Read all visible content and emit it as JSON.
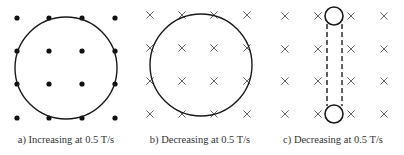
{
  "figure": {
    "panels": [
      {
        "id": "a",
        "caption": "a) Increasing at 0.5 T/s",
        "field_symbol": "dot",
        "field_direction": "out-of-page",
        "loop": "large-circle",
        "grid_x": [
          17,
          49,
          82,
          115
        ],
        "grid_y": [
          18,
          51,
          84,
          118
        ],
        "loop_geometry": {
          "cx": 66,
          "cy": 68,
          "r": 51
        },
        "caption_center_x": 66
      },
      {
        "id": "b",
        "caption": "b) Decreasing at 0.5 T/s",
        "field_symbol": "cross",
        "field_direction": "into-page",
        "loop": "large-circle",
        "grid_x": [
          150,
          182,
          214,
          247
        ],
        "grid_y": [
          15,
          48,
          81,
          114
        ],
        "loop_geometry": {
          "cx": 201,
          "cy": 65,
          "r": 51
        },
        "caption_center_x": 200
      },
      {
        "id": "c",
        "caption": "c) Decreasing at 0.5 T/s",
        "field_symbol": "cross",
        "field_direction": "into-page",
        "loop": "tube-with-end-circles",
        "grid_x": [
          285,
          318,
          351,
          384
        ],
        "grid_y": [
          16,
          49,
          81,
          114
        ],
        "loop_geometry": {
          "top_circle": {
            "cx": 334,
            "cy": 16,
            "r": 9
          },
          "bottom_circle": {
            "cx": 334,
            "cy": 114,
            "r": 9
          },
          "dashed_left_x": 327,
          "dashed_right_x": 342
        },
        "caption_center_x": 333
      }
    ],
    "colors": {
      "stroke": "#1a1a1a",
      "dot": "#111111",
      "cross": "#555555",
      "caption": "#333333"
    }
  }
}
